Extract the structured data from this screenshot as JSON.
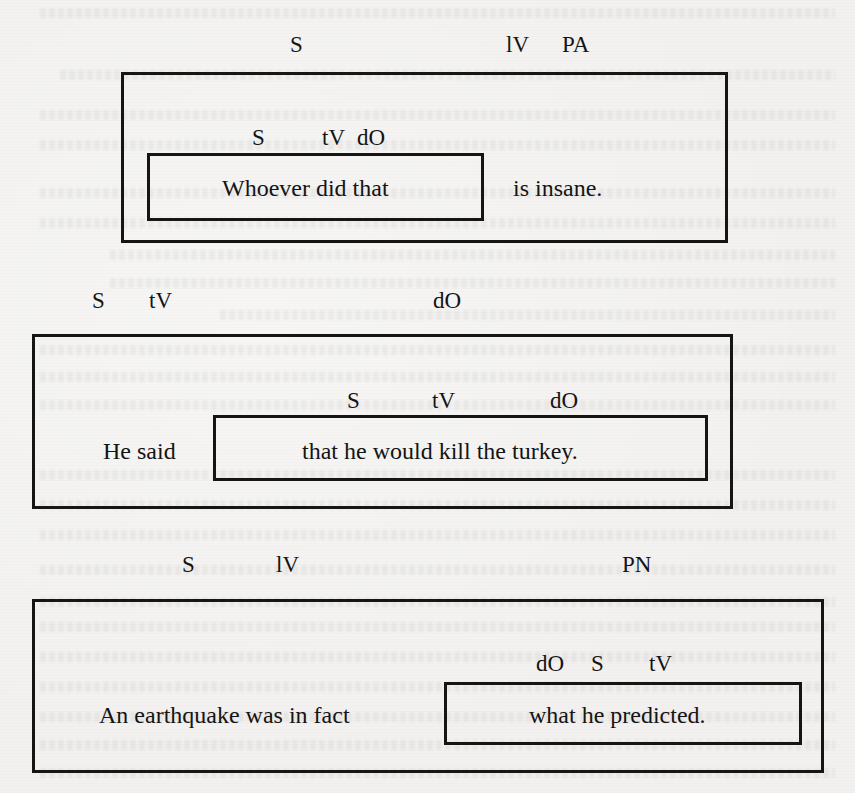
{
  "diagrams": [
    {
      "id": "diagram-1",
      "outer_labels": [
        {
          "text": "S",
          "x": 290,
          "y": 33
        },
        {
          "text": "lV",
          "x": 506,
          "y": 33
        },
        {
          "text": "PA",
          "x": 562,
          "y": 33
        }
      ],
      "outer_box": {
        "left": 121,
        "top": 72,
        "width": 607,
        "height": 171
      },
      "inner_labels": [
        {
          "text": "S",
          "x": 252,
          "y": 126
        },
        {
          "text": "tV",
          "x": 322,
          "y": 126
        },
        {
          "text": "dO",
          "x": 357,
          "y": 126
        }
      ],
      "inner_box": {
        "left": 147,
        "top": 153,
        "width": 337,
        "height": 68
      },
      "inner_text": "Whoever did that",
      "outer_text": "is insane."
    },
    {
      "id": "diagram-2",
      "outer_labels": [
        {
          "text": "S",
          "x": 92,
          "y": 289
        },
        {
          "text": "tV",
          "x": 149,
          "y": 289
        },
        {
          "text": "dO",
          "x": 433,
          "y": 289
        }
      ],
      "outer_box": {
        "left": 32,
        "top": 334,
        "width": 701,
        "height": 175
      },
      "inner_labels": [
        {
          "text": "S",
          "x": 347,
          "y": 389
        },
        {
          "text": "tV",
          "x": 432,
          "y": 389
        },
        {
          "text": "dO",
          "x": 550,
          "y": 389
        }
      ],
      "inner_box": {
        "left": 213,
        "top": 415,
        "width": 495,
        "height": 66
      },
      "inner_text": "that he would kill the turkey.",
      "outer_text": "He said"
    },
    {
      "id": "diagram-3",
      "outer_labels": [
        {
          "text": "S",
          "x": 182,
          "y": 553
        },
        {
          "text": "lV",
          "x": 276,
          "y": 553
        },
        {
          "text": "PN",
          "x": 622,
          "y": 553
        }
      ],
      "outer_box": {
        "left": 32,
        "top": 599,
        "width": 792,
        "height": 174
      },
      "inner_labels": [
        {
          "text": "dO",
          "x": 536,
          "y": 652
        },
        {
          "text": "S",
          "x": 591,
          "y": 652
        },
        {
          "text": "tV",
          "x": 649,
          "y": 652
        }
      ],
      "inner_box": {
        "left": 444,
        "top": 682,
        "width": 358,
        "height": 63
      },
      "inner_text": "what he predicted.",
      "outer_text": "An earthquake was in fact"
    }
  ]
}
